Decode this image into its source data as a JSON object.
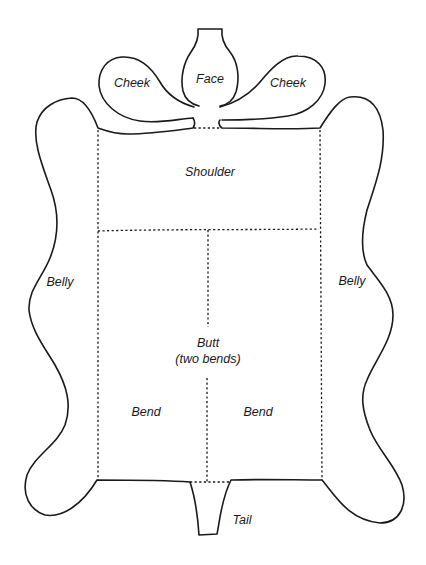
{
  "diagram": {
    "type": "leather hide cut diagram",
    "stroke_color": "#1a1a1a",
    "background": "#ffffff",
    "labels": {
      "face": "Face",
      "cheek_left": "Cheek",
      "cheek_right": "Cheek",
      "shoulder": "Shoulder",
      "belly_left": "Belly",
      "belly_right": "Belly",
      "butt_line1": "Butt",
      "butt_line2": "(two bends)",
      "bend_left": "Bend",
      "bend_right": "Bend",
      "tail": "Tail"
    },
    "regions": [
      "Face",
      "Cheek",
      "Cheek",
      "Shoulder",
      "Belly",
      "Belly",
      "Butt (two bends)",
      "Bend",
      "Bend",
      "Tail"
    ]
  }
}
